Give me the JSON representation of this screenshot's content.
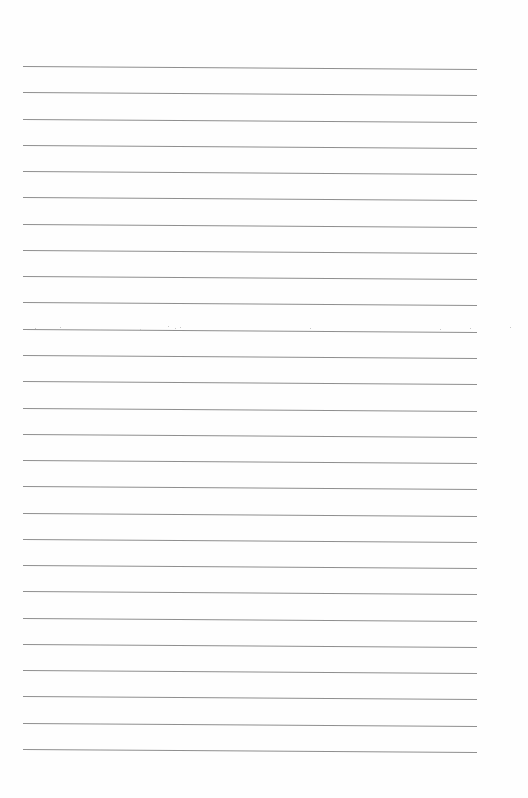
{
  "page": {
    "type": "lined-paper",
    "background_color": "#fefefe",
    "line_color": "#8f8f8f",
    "line_count": 27,
    "line_left_px": 23,
    "line_right_px": 477,
    "first_line_y_px": 66,
    "line_spacing_px": 26.27,
    "text": ""
  }
}
